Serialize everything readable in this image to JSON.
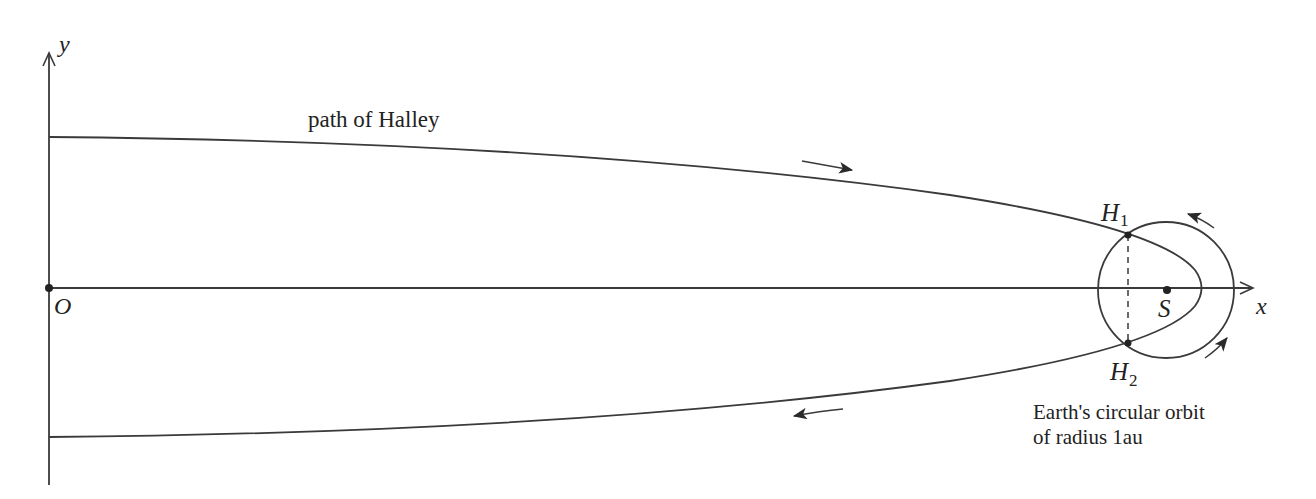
{
  "diagram": {
    "type": "orbit-geometry",
    "axes": {
      "x_label": "x",
      "y_label": "y",
      "origin_label": "O"
    },
    "labels": {
      "path": "path of Halley",
      "h1_main": "H",
      "h1_sub": "1",
      "h2_main": "H",
      "h2_sub": "2",
      "sun": "S",
      "orbit_line1": "Earth's circular orbit",
      "orbit_line2": "of radius 1au"
    },
    "points": [
      {
        "name": "O",
        "x": 49,
        "y": 288
      },
      {
        "name": "S",
        "x": 1167,
        "y": 290
      },
      {
        "name": "H1",
        "x": 1128,
        "y": 235
      },
      {
        "name": "H2",
        "x": 1128,
        "y": 343
      }
    ],
    "circle": {
      "cx": 1166,
      "cy": 290,
      "r": 68
    },
    "colors": {
      "ink": "#3a3a3a",
      "background": "#ffffff"
    }
  }
}
